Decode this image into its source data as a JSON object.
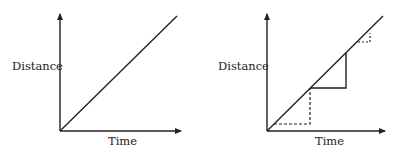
{
  "diagrams": [
    {
      "id": "left",
      "ylabel": "Distance",
      "xlabel": "Time",
      "description": "Straight line distance-time graph"
    },
    {
      "id": "right",
      "ylabel": "Distance",
      "xlabel": "Time",
      "description": "Straight line with gradient triangles (dashed, solid, small dashed)"
    }
  ],
  "colors": {
    "line": "#222222",
    "background": "#ffffff"
  }
}
